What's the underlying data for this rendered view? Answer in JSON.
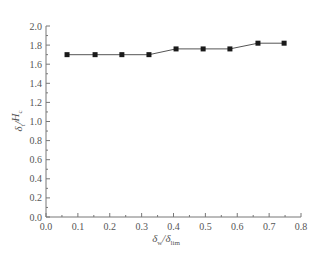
{
  "chart_data": {
    "type": "line",
    "title": "",
    "xlabel": "δw/δlim",
    "ylabel": "δt/Hc",
    "xlabel_parts": {
      "main": "δ",
      "sub1": "w",
      "sep": "/",
      "main2": "δ",
      "sub2": "lim"
    },
    "ylabel_parts": {
      "main": "δ",
      "sub1": "t",
      "sep": "/",
      "main2": "H",
      "sub2": "c"
    },
    "xlim": [
      0.0,
      0.8
    ],
    "ylim": [
      0.0,
      2.0
    ],
    "xticks": [
      "0.0",
      "0.1",
      "0.2",
      "0.3",
      "0.4",
      "0.5",
      "0.6",
      "0.7",
      "0.8"
    ],
    "yticks": [
      "0.0",
      "0.2",
      "0.4",
      "0.6",
      "0.8",
      "1.0",
      "1.2",
      "1.4",
      "1.6",
      "1.8",
      "2.0"
    ],
    "grid": false,
    "legend": null,
    "series": [
      {
        "name": "δt/Hc",
        "marker": "square",
        "color": "#333333",
        "x": [
          0.066,
          0.154,
          0.238,
          0.323,
          0.408,
          0.493,
          0.577,
          0.665,
          0.747
        ],
        "y": [
          1.7,
          1.7,
          1.7,
          1.7,
          1.76,
          1.76,
          1.76,
          1.82,
          1.82
        ]
      }
    ]
  },
  "colors": {
    "axis": "#777777",
    "line": "#555555",
    "marker": "#1a1a1a"
  }
}
